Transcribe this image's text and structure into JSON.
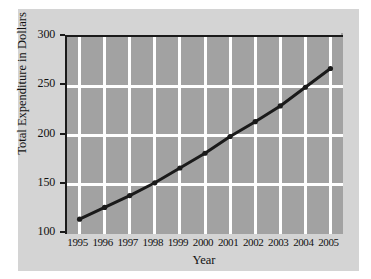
{
  "chart_data": {
    "type": "line",
    "title": "",
    "xlabel": "Year",
    "ylabel": "Total Expenditure in Dollars",
    "categories": [
      "1995",
      "1996",
      "1997",
      "1998",
      "1999",
      "2000",
      "2001",
      "2002",
      "2003",
      "2004",
      "2005"
    ],
    "values": [
      115,
      127,
      139,
      152,
      167,
      182,
      199,
      214,
      230,
      249,
      268
    ],
    "series": [
      {
        "name": "Total Expenditure",
        "values": [
          115,
          127,
          139,
          152,
          167,
          182,
          199,
          214,
          230,
          249,
          268
        ]
      }
    ],
    "ylim": [
      100,
      300
    ],
    "yticks": [
      100,
      150,
      200,
      250,
      300
    ],
    "ytick_labels": [
      "100",
      "150",
      "200",
      "250",
      "300"
    ],
    "xtick_labels": [
      "1995",
      "1996",
      "1997",
      "1998",
      "1999",
      "2000",
      "2001",
      "2002",
      "2003",
      "2004",
      "2005"
    ],
    "grid": true,
    "gridline_color": "#ffffff",
    "legend": "none",
    "marker": "circle",
    "plot_background": "#a2a2a2",
    "panel_background": "#d4d4d4",
    "line_color": "#1a1a1a",
    "axis_color": "#1a1a1a",
    "text_color": "#111111"
  }
}
